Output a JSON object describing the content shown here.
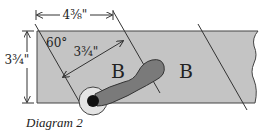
{
  "diagram": {
    "caption": "Diagram 2",
    "dimensions": {
      "top_width": "4⅜\"",
      "left_height": "3¾\"",
      "diagonal_width": "3¾\"",
      "angle": "60°"
    },
    "region_labels": [
      "B",
      "B"
    ],
    "colors": {
      "board_fill": "#c4c4c4",
      "line": "#333333",
      "handle_fill": "#7a7a7a",
      "ring_fill": "#e4e4e4",
      "pivot_fill": "#111111"
    }
  }
}
